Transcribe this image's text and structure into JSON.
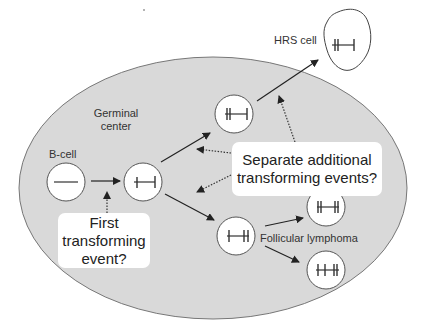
{
  "regions": {
    "germinal_center": {
      "label_line1": "Germinal",
      "label_line2": "center"
    }
  },
  "labels": {
    "b_cell": "B-cell",
    "hrs_cell": "HRS cell",
    "follicular_lymphoma": "Follicular lymphoma"
  },
  "callouts": {
    "first_event": {
      "line1": "First",
      "line2": "transforming",
      "line3": "event?"
    },
    "separate_events": {
      "line1": "Separate additional",
      "line2": "transforming events?"
    }
  },
  "nodes": [
    {
      "id": "b-cell",
      "glyph": "plain-line",
      "shape": "circle"
    },
    {
      "id": "first-transformed-cell",
      "glyph": "single-bar-both-ends",
      "shape": "circle"
    },
    {
      "id": "upper-branch-cell",
      "glyph": "double-bar-left",
      "shape": "circle"
    },
    {
      "id": "hrs-cell",
      "glyph": "double-bar-left",
      "shape": "irregular"
    },
    {
      "id": "lower-branch-cell",
      "glyph": "double-bar-right",
      "shape": "circle"
    },
    {
      "id": "fl-cell-a",
      "glyph": "double-bar-both-ends",
      "shape": "circle"
    },
    {
      "id": "fl-cell-b",
      "glyph": "triple-bar-right",
      "shape": "circle"
    }
  ],
  "colors": {
    "germinal_center_fill": "#d9d9d9",
    "outline": "#666666",
    "arrow": "#222222",
    "cell_fill": "#ffffff",
    "text": "#333333"
  }
}
